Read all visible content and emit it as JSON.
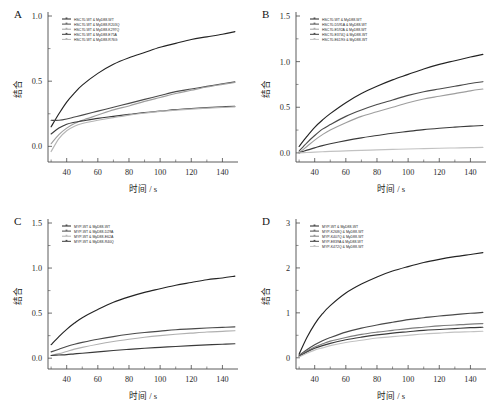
{
  "figure": {
    "axis_x_label": "时间 / s",
    "axis_y_label": "结合"
  },
  "chart_data": [
    {
      "type": "line",
      "panel": "A",
      "title": "",
      "xlabel": "时间 / s",
      "ylabel": "结合",
      "xlim": [
        28,
        150
      ],
      "ylim": [
        -0.12,
        1.0
      ],
      "xticks": [
        40,
        60,
        80,
        100,
        120,
        140
      ],
      "yticks": [
        "0.0",
        "0.5",
        "1.0"
      ],
      "ytick_values": [
        0.0,
        0.5,
        1.0
      ],
      "grid": false,
      "legend_position": "top-left",
      "x": [
        30,
        35,
        40,
        45,
        50,
        60,
        70,
        80,
        90,
        100,
        110,
        120,
        130,
        140,
        148
      ],
      "series": [
        {
          "name": "HSC70-WT & MyD88-WT",
          "color": "#232323",
          "values": [
            0.15,
            0.25,
            0.34,
            0.41,
            0.47,
            0.56,
            0.63,
            0.68,
            0.72,
            0.76,
            0.79,
            0.82,
            0.84,
            0.86,
            0.88
          ]
        },
        {
          "name": "HSC70-WT & MyD88-R203Q",
          "color": "#4a4a4a",
          "values": [
            0.2,
            0.2,
            0.21,
            0.225,
            0.24,
            0.27,
            0.3,
            0.33,
            0.36,
            0.39,
            0.42,
            0.44,
            0.46,
            0.48,
            0.495
          ]
        },
        {
          "name": "HSC70-WT & MyD88-K297Q",
          "color": "#9e9e9e",
          "values": [
            0.02,
            0.09,
            0.14,
            0.175,
            0.2,
            0.24,
            0.28,
            0.31,
            0.345,
            0.375,
            0.405,
            0.43,
            0.455,
            0.475,
            0.49
          ]
        },
        {
          "name": "HSC70-WT & MyD88-E75A",
          "color": "#3a3a3a",
          "values": [
            0.095,
            0.14,
            0.17,
            0.185,
            0.195,
            0.215,
            0.23,
            0.245,
            0.26,
            0.27,
            0.282,
            0.29,
            0.297,
            0.303,
            0.308
          ]
        },
        {
          "name": "HSC70-WT & MyD88-R76G",
          "color": "#b5b5b5",
          "values": [
            -0.04,
            0.06,
            0.12,
            0.155,
            0.175,
            0.2,
            0.22,
            0.24,
            0.255,
            0.268,
            0.278,
            0.286,
            0.293,
            0.299,
            0.303
          ]
        }
      ]
    },
    {
      "type": "line",
      "panel": "B",
      "title": "",
      "xlabel": "时间 / s",
      "ylabel": "结合",
      "xlim": [
        28,
        150
      ],
      "ylim": [
        -0.1,
        1.5
      ],
      "xticks": [
        40,
        60,
        80,
        100,
        120,
        140
      ],
      "yticks": [
        "0.0",
        "0.5",
        "1.0",
        "1.5"
      ],
      "ytick_values": [
        0.0,
        0.5,
        1.0,
        1.5
      ],
      "grid": false,
      "legend_position": "top-left",
      "x": [
        30,
        35,
        40,
        45,
        50,
        60,
        70,
        80,
        90,
        100,
        110,
        120,
        130,
        140,
        148
      ],
      "series": [
        {
          "name": "HSC70-WT & MyD88-WT",
          "color": "#232323",
          "values": [
            0.07,
            0.18,
            0.28,
            0.36,
            0.43,
            0.55,
            0.65,
            0.73,
            0.8,
            0.86,
            0.92,
            0.97,
            1.01,
            1.05,
            1.08
          ]
        },
        {
          "name": "HSC70-D591A & MyD88-WT",
          "color": "#4a4a4a",
          "values": [
            0.02,
            0.11,
            0.19,
            0.26,
            0.31,
            0.4,
            0.47,
            0.53,
            0.58,
            0.63,
            0.67,
            0.7,
            0.73,
            0.76,
            0.78
          ]
        },
        {
          "name": "HSC70-E592A & MyD88-WT",
          "color": "#9e9e9e",
          "values": [
            0.0,
            0.07,
            0.14,
            0.2,
            0.25,
            0.33,
            0.4,
            0.45,
            0.5,
            0.55,
            0.59,
            0.62,
            0.65,
            0.68,
            0.7
          ]
        },
        {
          "name": "HSC70-E374Q & MyD88-WT",
          "color": "#3a3a3a",
          "values": [
            0.0,
            0.03,
            0.055,
            0.08,
            0.1,
            0.135,
            0.165,
            0.19,
            0.215,
            0.235,
            0.255,
            0.27,
            0.282,
            0.293,
            0.3
          ]
        },
        {
          "name": "HSC70-E619G & MyD88-WT",
          "color": "#c2c2c2",
          "values": [
            0.0,
            0.004,
            0.008,
            0.012,
            0.016,
            0.022,
            0.028,
            0.033,
            0.038,
            0.043,
            0.047,
            0.051,
            0.054,
            0.057,
            0.06
          ]
        }
      ]
    },
    {
      "type": "line",
      "panel": "C",
      "title": "",
      "xlabel": "时间 / s",
      "ylabel": "结合",
      "xlim": [
        28,
        150
      ],
      "ylim": [
        -0.12,
        1.5
      ],
      "xticks": [
        40,
        60,
        80,
        100,
        120,
        140
      ],
      "yticks": [
        "0.0",
        "0.5",
        "1.0",
        "1.5"
      ],
      "ytick_values": [
        0.0,
        0.5,
        1.0,
        1.5
      ],
      "grid": false,
      "legend_position": "top-left",
      "x": [
        30,
        35,
        40,
        45,
        50,
        60,
        70,
        80,
        90,
        100,
        110,
        120,
        130,
        140,
        148
      ],
      "series": [
        {
          "name": "MYP-WT & MyD88-WT",
          "color": "#232323",
          "values": [
            0.15,
            0.24,
            0.32,
            0.39,
            0.45,
            0.54,
            0.62,
            0.68,
            0.73,
            0.77,
            0.81,
            0.84,
            0.87,
            0.89,
            0.91
          ]
        },
        {
          "name": "MYP-WT & MyD88-D29A",
          "color": "#4a4a4a",
          "values": [
            0.07,
            0.1,
            0.13,
            0.155,
            0.175,
            0.21,
            0.24,
            0.265,
            0.285,
            0.3,
            0.315,
            0.325,
            0.335,
            0.342,
            0.348
          ]
        },
        {
          "name": "MYP-WT & MyD88-E62A",
          "color": "#b0b0b0",
          "values": [
            0.03,
            0.05,
            0.075,
            0.1,
            0.12,
            0.155,
            0.185,
            0.21,
            0.232,
            0.25,
            0.265,
            0.278,
            0.29,
            0.298,
            0.305
          ]
        },
        {
          "name": "MYP-WT & MyD88-R40Q",
          "color": "#3a3a3a",
          "values": [
            0.03,
            0.035,
            0.04,
            0.048,
            0.055,
            0.07,
            0.085,
            0.098,
            0.11,
            0.12,
            0.13,
            0.14,
            0.148,
            0.155,
            0.16
          ]
        }
      ]
    },
    {
      "type": "line",
      "panel": "D",
      "title": "",
      "xlabel": "时间 / s",
      "ylabel": "结合",
      "xlim": [
        28,
        150
      ],
      "ylim": [
        -0.25,
        3.0
      ],
      "xticks": [
        40,
        60,
        80,
        100,
        120,
        140
      ],
      "yticks": [
        "0",
        "1",
        "2",
        "3"
      ],
      "ytick_values": [
        0,
        1,
        2,
        3
      ],
      "grid": false,
      "legend_position": "top-left",
      "x": [
        30,
        35,
        40,
        45,
        50,
        60,
        70,
        80,
        90,
        100,
        110,
        120,
        130,
        140,
        148
      ],
      "series": [
        {
          "name": "MYP-WT & MyD88-WT",
          "color": "#232323",
          "values": [
            0.08,
            0.45,
            0.75,
            0.98,
            1.16,
            1.44,
            1.64,
            1.8,
            1.93,
            2.03,
            2.12,
            2.19,
            2.25,
            2.3,
            2.34
          ]
        },
        {
          "name": "MYP-K268Q & MyD88-WT",
          "color": "#4a4a4a",
          "values": [
            0.05,
            0.18,
            0.29,
            0.38,
            0.45,
            0.57,
            0.66,
            0.73,
            0.79,
            0.85,
            0.89,
            0.93,
            0.96,
            0.99,
            1.01
          ]
        },
        {
          "name": "MYP-K407Q & MyD88-WT",
          "color": "#7d7d7d",
          "values": [
            0.04,
            0.15,
            0.24,
            0.31,
            0.37,
            0.45,
            0.52,
            0.57,
            0.61,
            0.65,
            0.68,
            0.71,
            0.73,
            0.75,
            0.76
          ]
        },
        {
          "name": "MYP-E839A & MyD88-WT",
          "color": "#3a3a3a",
          "values": [
            0.03,
            0.13,
            0.21,
            0.27,
            0.32,
            0.4,
            0.46,
            0.51,
            0.55,
            0.58,
            0.61,
            0.63,
            0.65,
            0.67,
            0.68
          ]
        },
        {
          "name": "MYP-K472Q & MyD88-WT",
          "color": "#c2c2c2",
          "values": [
            0.02,
            0.1,
            0.17,
            0.22,
            0.27,
            0.34,
            0.39,
            0.44,
            0.47,
            0.5,
            0.53,
            0.55,
            0.57,
            0.58,
            0.59
          ]
        }
      ]
    }
  ],
  "panels": [
    {
      "id": "A",
      "label": "A"
    },
    {
      "id": "B",
      "label": "B"
    },
    {
      "id": "C",
      "label": "C"
    },
    {
      "id": "D",
      "label": "D"
    }
  ]
}
